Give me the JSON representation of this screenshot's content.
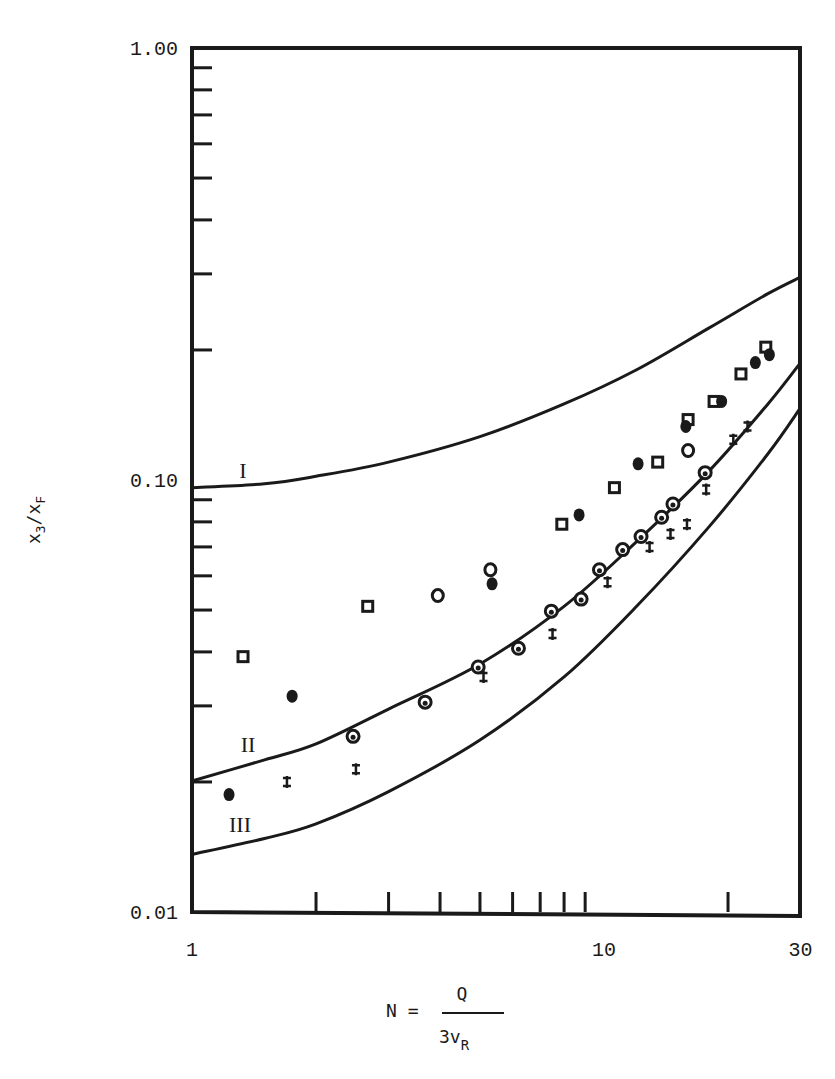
{
  "chart_data": {
    "type": "scatter",
    "title": "",
    "xlabel": "N = Q / 3v_R",
    "xlabel_parts": {
      "lhs": "N =",
      "numerator": "Q",
      "denominator": "3v",
      "denominator_sub": "R"
    },
    "ylabel": "x3/xF",
    "ylabel_parts": {
      "main": "x",
      "sub1": "3",
      "slash": "/x",
      "sub2": "F"
    },
    "xscale": "log",
    "yscale": "log",
    "xlim": [
      1,
      30
    ],
    "ylim": [
      0.01,
      1.0
    ],
    "grid": false,
    "legend": "none",
    "x_tick_labels": [
      "1",
      "10",
      "30"
    ],
    "y_tick_labels": [
      "1.00",
      "0.10",
      "0.01"
    ],
    "x_minor_ticks": [
      2,
      3,
      4,
      5,
      6,
      7,
      8,
      9,
      20
    ],
    "y_minor_ticks": [
      0.9,
      0.8,
      0.7,
      0.6,
      0.5,
      0.4,
      0.3,
      0.2,
      0.09,
      0.08,
      0.07,
      0.06,
      0.05,
      0.04,
      0.03,
      0.02
    ],
    "curves": [
      {
        "name": "I",
        "label": "I",
        "x": [
          1,
          1.5,
          2,
          3,
          5,
          8,
          12,
          18,
          25,
          30
        ],
        "y": [
          0.096,
          0.098,
          0.102,
          0.11,
          0.126,
          0.15,
          0.18,
          0.225,
          0.27,
          0.295
        ]
      },
      {
        "name": "II",
        "label": "II",
        "x": [
          1,
          1.5,
          2,
          3,
          5,
          8,
          12,
          18,
          25,
          30
        ],
        "y": [
          0.0201,
          0.0225,
          0.0245,
          0.0295,
          0.0375,
          0.051,
          0.072,
          0.105,
          0.15,
          0.187
        ]
      },
      {
        "name": "III",
        "label": "III",
        "x": [
          1,
          1.5,
          2,
          3,
          5,
          8,
          12,
          18,
          25,
          30
        ],
        "y": [
          0.0136,
          0.0148,
          0.016,
          0.019,
          0.025,
          0.035,
          0.051,
          0.078,
          0.115,
          0.147
        ]
      }
    ],
    "series": [
      {
        "name": "open squares",
        "marker": "square-open",
        "x": [
          1.33,
          2.67,
          7.9,
          10.6,
          13.5,
          16.0,
          18.5,
          21.5,
          24.7
        ],
        "y": [
          0.039,
          0.051,
          0.079,
          0.096,
          0.11,
          0.138,
          0.152,
          0.176,
          0.203
        ]
      },
      {
        "name": "filled circles",
        "marker": "circle-filled",
        "x": [
          1.23,
          1.75,
          5.35,
          8.7,
          12.1,
          15.8,
          19.3,
          23.3,
          25.2
        ],
        "y": [
          0.0187,
          0.0316,
          0.0575,
          0.083,
          0.109,
          0.133,
          0.152,
          0.187,
          0.195
        ]
      },
      {
        "name": "open circles",
        "marker": "circle-open",
        "x": [
          3.95,
          5.3,
          16.0
        ],
        "y": [
          0.054,
          0.062,
          0.117
        ]
      },
      {
        "name": "half-filled circles on curve II",
        "marker": "circle-half",
        "x": [
          2.46,
          3.68,
          4.95,
          6.2,
          7.45,
          8.8,
          9.75,
          11.1,
          12.3,
          13.8,
          14.7,
          17.6
        ],
        "y": [
          0.0255,
          0.0306,
          0.0369,
          0.0408,
          0.0497,
          0.053,
          0.062,
          0.069,
          0.074,
          0.082,
          0.088,
          0.104
        ]
      },
      {
        "name": "crosses",
        "marker": "double-cross",
        "x": [
          1.7,
          2.5,
          5.1,
          7.5,
          10.2,
          12.9,
          14.5,
          15.9,
          17.7,
          20.6,
          22.3
        ],
        "y": [
          0.02,
          0.0214,
          0.035,
          0.044,
          0.058,
          0.07,
          0.075,
          0.079,
          0.095,
          0.124,
          0.133
        ]
      }
    ]
  },
  "colors": {
    "ink": "#1a1a1a",
    "background": "#ffffff"
  }
}
